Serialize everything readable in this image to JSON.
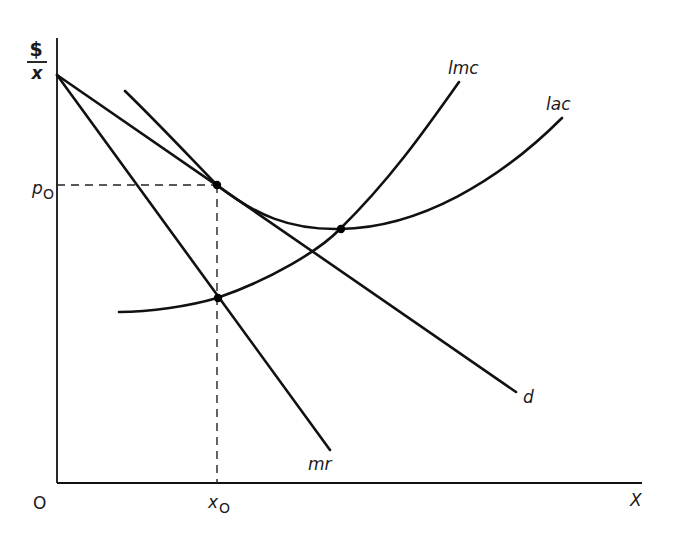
{
  "diagram": {
    "type": "monopolistic-competition-long-run-equilibrium",
    "axes": {
      "y_label_numerator": "$",
      "y_label_denominator": "x",
      "x_label": "X",
      "origin_label": "O"
    },
    "ticks": {
      "price": {
        "label_main": "p",
        "label_sub": "O"
      },
      "quantity": {
        "label_main": "x",
        "label_sub": "O"
      }
    },
    "curves": [
      {
        "id": "lmc",
        "label": "lmc",
        "description": "long-run marginal cost"
      },
      {
        "id": "lac",
        "label": "lac",
        "description": "long-run average cost (with accent mark)"
      },
      {
        "id": "d",
        "label": "d",
        "description": "demand"
      },
      {
        "id": "mr",
        "label": "mr",
        "description": "marginal revenue"
      }
    ],
    "points": [
      {
        "id": "tangency",
        "description": "d tangent to lac at (x0, p0)"
      },
      {
        "id": "mr-lmc",
        "description": "mr intersects lmc at x0"
      },
      {
        "id": "lac-min",
        "description": "lmc intersects lac at lac minimum"
      }
    ],
    "colors": {
      "ink": "#111111",
      "background": "#ffffff"
    }
  }
}
